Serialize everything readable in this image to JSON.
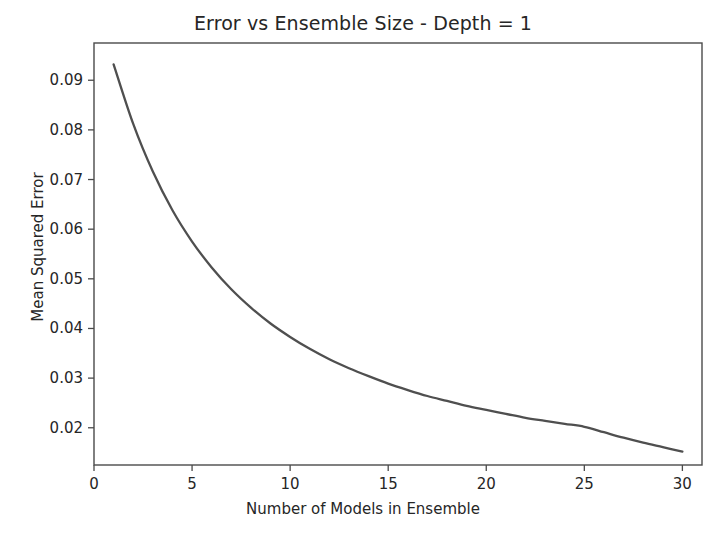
{
  "chart_data": {
    "type": "line",
    "title": "Error vs Ensemble Size - Depth = 1",
    "xlabel": "Number of Models in Ensemble",
    "ylabel": "Mean Squared Error",
    "xlim": [
      0,
      31
    ],
    "ylim": [
      0.0125,
      0.0975
    ],
    "xticks": [
      0,
      5,
      10,
      15,
      20,
      25,
      30
    ],
    "xticklabels": [
      "0",
      "5",
      "10",
      "15",
      "20",
      "25",
      "30"
    ],
    "yticks": [
      0.02,
      0.03,
      0.04,
      0.05,
      0.06,
      0.07,
      0.08,
      0.09
    ],
    "yticklabels": [
      "0.02",
      "0.03",
      "0.04",
      "0.05",
      "0.06",
      "0.07",
      "0.08",
      "0.09"
    ],
    "grid": false,
    "legend": null,
    "line_color": "#4f4f4f",
    "background_color": "#ffffff",
    "series": [
      {
        "name": "Mean Squared Error",
        "x": [
          1,
          2,
          3,
          4,
          5,
          6,
          7,
          8,
          9,
          10,
          11,
          12,
          13,
          14,
          15,
          16,
          17,
          18,
          19,
          20,
          21,
          22,
          23,
          24,
          25,
          26,
          27,
          28,
          29,
          30
        ],
        "values": [
          0.0932,
          0.0812,
          0.0716,
          0.0638,
          0.0575,
          0.0523,
          0.0479,
          0.0442,
          0.041,
          0.0383,
          0.0359,
          0.0338,
          0.032,
          0.0304,
          0.0289,
          0.0276,
          0.0264,
          0.0254,
          0.0244,
          0.0236,
          0.0228,
          0.022,
          0.0214,
          0.0208,
          0.0202,
          0.0191,
          0.018,
          0.017,
          0.0161,
          0.0152
        ]
      }
    ]
  }
}
